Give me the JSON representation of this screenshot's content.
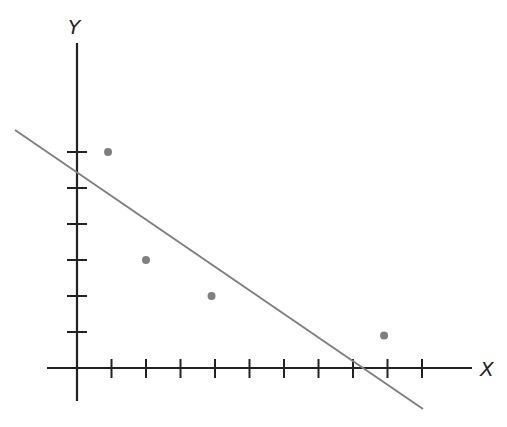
{
  "chart_data": {
    "type": "scatter",
    "title": "",
    "xlabel": "X",
    "ylabel": "Y",
    "x_ticks": [
      1,
      2,
      3,
      4,
      5,
      6,
      7,
      8,
      9,
      10
    ],
    "y_ticks": [
      1,
      2,
      3,
      4,
      5,
      6
    ],
    "tick_labels_shown": false,
    "grid": false,
    "xlim": [
      -0.9,
      11.3
    ],
    "ylim": [
      -0.9,
      9.0
    ],
    "series": [
      {
        "name": "points",
        "type": "scatter",
        "x": [
          0.9,
          2.0,
          3.9,
          8.9
        ],
        "y": [
          6.0,
          3.0,
          2.0,
          0.9
        ],
        "color": "#7f7f7f"
      },
      {
        "name": "fitted line",
        "type": "line",
        "x": [
          -1.8,
          10.0
        ],
        "y": [
          6.6,
          -1.15
        ],
        "color": "#7f7f7f",
        "note": "line crosses Y axis near y=5.5 and X axis near x=8.2"
      }
    ]
  },
  "colors": {
    "axis": "#222222",
    "line": "#808080",
    "point": "#7f7f7f"
  }
}
